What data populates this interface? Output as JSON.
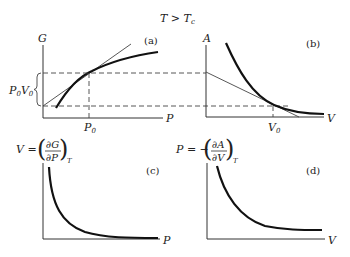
{
  "title": {
    "main": "T > T",
    "sub": "c"
  },
  "panels": {
    "a": {
      "tag": "(a)",
      "y_axis": "G",
      "x_axis": "P",
      "x_mark": {
        "main": "P",
        "sub": "0"
      },
      "brace_label": {
        "p": "P",
        "p_sub": "0",
        "v": "V",
        "v_sub": "0"
      }
    },
    "b": {
      "tag": "(b)",
      "y_axis": "A",
      "x_axis": "V",
      "x_mark": {
        "main": "V",
        "sub": "0"
      }
    },
    "c": {
      "tag": "(c)",
      "y_axis_formula": {
        "lhs": "V =",
        "num": "∂G",
        "den": "∂P",
        "sub": "T"
      },
      "x_axis": "P"
    },
    "d": {
      "tag": "(d)",
      "y_axis_formula": {
        "lhs": "P = −",
        "num": "∂A",
        "den": "∂V",
        "sub": "T"
      },
      "x_axis": "V"
    }
  }
}
